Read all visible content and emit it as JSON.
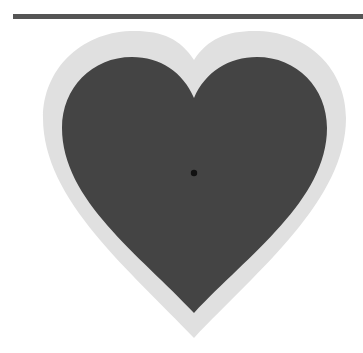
{
  "colors": {
    "background": "#ffffff",
    "top_bar": "#555555",
    "heart_border": "#e0e0e0",
    "heart_fill": "#444444",
    "center_dot": "#111111"
  },
  "shapes": {
    "top_bar": {
      "x": 13,
      "y": 14,
      "width": 350,
      "height": 5
    },
    "heart_outer": {
      "notch": [
        194,
        60
      ],
      "tip": [
        194,
        338
      ],
      "left": 43,
      "right": 346
    },
    "heart_inner": {
      "notch": [
        194,
        98
      ],
      "tip": [
        194,
        313
      ],
      "left": 62,
      "right": 327
    },
    "center_dot": {
      "cx": 194,
      "cy": 173,
      "r": 3.2
    }
  }
}
